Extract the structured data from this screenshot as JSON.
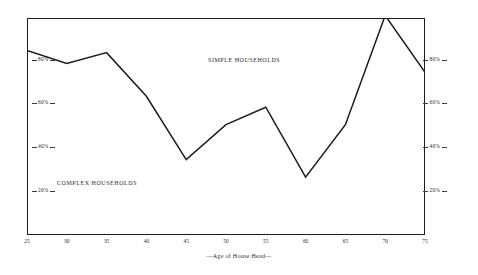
{
  "chart_data": {
    "type": "line",
    "title": "",
    "subtitle": "",
    "xlabel": "—Age of House Head—",
    "ylabel": "",
    "xlim": [
      25,
      75
    ],
    "ylim": [
      0,
      100
    ],
    "grid": false,
    "legend_position": "inline-annotations",
    "x": [
      25,
      30,
      35,
      40,
      45,
      50,
      55,
      60,
      65,
      70,
      75
    ],
    "series": [
      {
        "name": "Simple households",
        "values": [
          83,
          77,
          82,
          62,
          33,
          49,
          57,
          25,
          49,
          99,
          73
        ],
        "color": "#1c1c1c"
      }
    ],
    "x_tick_labels": [
      "25",
      "30",
      "35",
      "40",
      "45",
      "50",
      "55",
      "60",
      "65",
      "70",
      "75"
    ],
    "y_tick_values": [
      80,
      60,
      40,
      20
    ],
    "y_tick_labels_left": [
      "80%",
      "60%",
      "40%",
      "20%"
    ],
    "y_tick_labels_right": [
      "80%",
      "60%",
      "40%",
      "20%"
    ],
    "annotations": [
      {
        "text": "SIMPLE HOUSEHOLDS",
        "x": 52,
        "y": 88,
        "region": "above-curve"
      },
      {
        "text": "COMPLEX HOUSEHOLDS",
        "x": 32,
        "y": 24,
        "region": "below-curve"
      }
    ]
  },
  "figure": {
    "x_axis_title": "—Age of House Head—",
    "simple_label": "SIMPLE HOUSEHOLDS",
    "complex_label": "COMPLEX HOUSEHOLDS",
    "line_color": "#1c1c1c",
    "frame_color": "#1c1c1c",
    "background": "#ffffff"
  }
}
